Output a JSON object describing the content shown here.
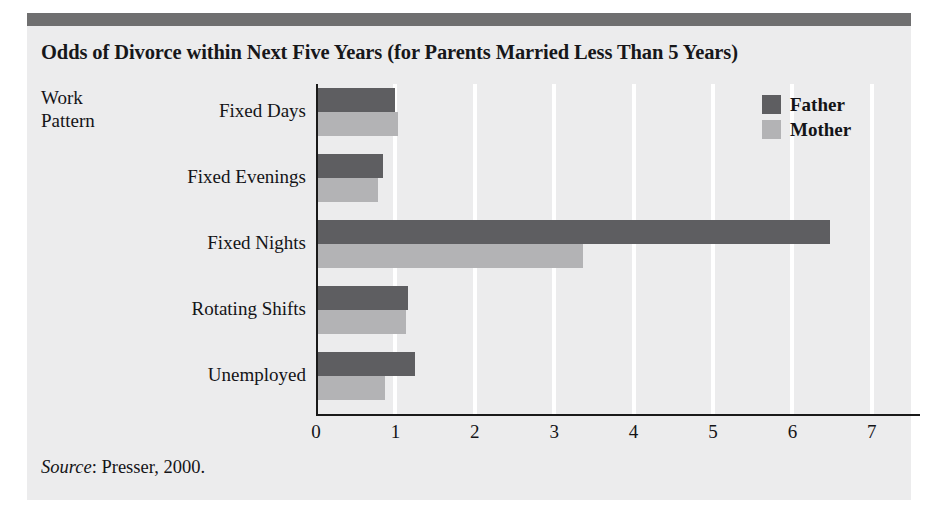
{
  "figure": {
    "title": "Odds of Divorce within Next Five Years (for Parents Married Less Than 5 Years)",
    "axis_caption_line1": "Work",
    "axis_caption_line2": "Pattern",
    "source_label": "Source",
    "source_text": ": Presser, 2000.",
    "colors": {
      "panel_background": "#ececed",
      "header_bar": "#6f6f70",
      "father_bar": "#5e5e61",
      "mother_bar": "#b3b3b5",
      "gridline": "#ffffff",
      "axis": "#1a1a1a",
      "text": "#141417"
    }
  },
  "chart_data": {
    "type": "bar",
    "orientation": "horizontal",
    "title": "Odds of Divorce within Next Five Years (for Parents Married Less Than 5 Years)",
    "xlabel": "",
    "ylabel": "Work Pattern",
    "categories": [
      "Fixed Days",
      "Fixed Evenings",
      "Fixed Nights",
      "Rotating Shifts",
      "Unemployed"
    ],
    "series": [
      {
        "name": "Father",
        "color": "#5e5e61",
        "values": [
          1.0,
          0.85,
          6.47,
          1.16,
          1.25
        ]
      },
      {
        "name": "Mother",
        "color": "#b3b3b5",
        "values": [
          1.03,
          0.78,
          3.36,
          1.13,
          0.87
        ]
      }
    ],
    "xlim": [
      0,
      7
    ],
    "xticks": [
      0,
      1,
      2,
      3,
      4,
      5,
      6,
      7
    ],
    "xtick_labels": [
      "0",
      "1",
      "2",
      "3",
      "4",
      "5",
      "6",
      "7"
    ],
    "grid": "vertical-white-gridlines",
    "legend_position": "top-right",
    "source": "Source: Presser, 2000."
  }
}
